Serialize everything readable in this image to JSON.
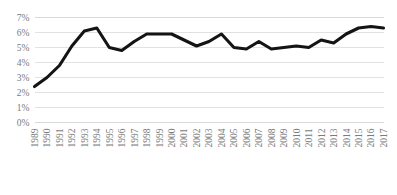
{
  "chart_data": {
    "type": "line",
    "title": "",
    "subtitle": "",
    "xlabel": "",
    "ylabel": "",
    "grid": true,
    "legend": false,
    "legend_position": "none",
    "line_color": "#141414",
    "gridline_color": "#e2e2e2",
    "tick_label_color": "#7b7b7b",
    "ylim": [
      0,
      7
    ],
    "ytick_labels": [
      "0%",
      "1%",
      "2%",
      "3%",
      "4%",
      "5%",
      "6%",
      "7%"
    ],
    "ytick_values": [
      0,
      1,
      2,
      3,
      4,
      5,
      6,
      7
    ],
    "categories": [
      "1989",
      "1990",
      "1991",
      "1992",
      "1993",
      "1994",
      "1995",
      "1996",
      "1997",
      "1998",
      "1999",
      "2000",
      "2001",
      "2002",
      "2003",
      "2004",
      "2005",
      "2006",
      "2007",
      "2008",
      "2009",
      "2010",
      "2011",
      "2012",
      "2013",
      "2014",
      "2015",
      "2016",
      "2017"
    ],
    "values": [
      2.4,
      3.0,
      3.8,
      5.1,
      6.1,
      6.3,
      5.0,
      4.8,
      5.4,
      5.9,
      5.9,
      5.9,
      5.5,
      5.1,
      5.4,
      5.9,
      5.0,
      4.9,
      5.4,
      4.9,
      5.0,
      5.1,
      5.0,
      5.5,
      5.3,
      5.9,
      6.3,
      6.4,
      6.3
    ],
    "xtick_rotation": -90
  }
}
